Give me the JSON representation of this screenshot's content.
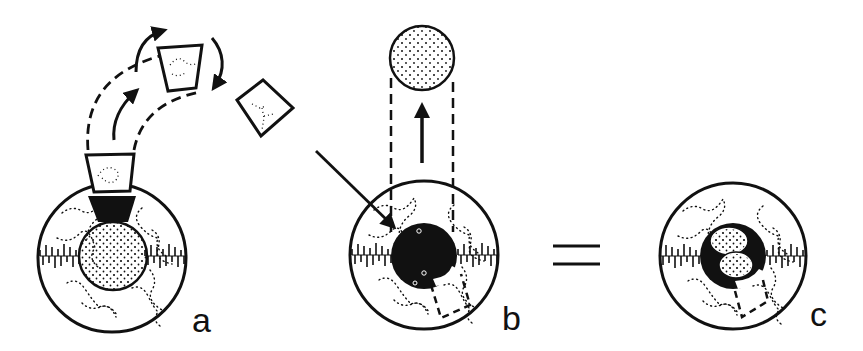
{
  "diagram": {
    "type": "illustration",
    "panels": [
      {
        "id": "a",
        "label": "a",
        "contents": [
          "outer ring with dotted texture",
          "dotted inner circle",
          "black wedge segment",
          "trapezoid piece lifted along dashed arc",
          "two rotated trapezoid pieces",
          "curved arrows"
        ]
      },
      {
        "id": "b",
        "label": "b",
        "contents": [
          "outer ring with dotted texture",
          "black central disc",
          "dotted circle lifted upward",
          "dashed vertical guides",
          "up arrow",
          "diagonal arrow pointing into disc",
          "dashed rectangle segment"
        ]
      },
      {
        "id": "c",
        "label": "c",
        "contents": [
          "outer ring with dotted texture",
          "black central disc",
          "two dotted ovals inside disc",
          "dashed rectangle segment"
        ]
      }
    ],
    "operator": "="
  },
  "labels": {
    "a": "a",
    "b": "b",
    "c": "c",
    "equals": "="
  },
  "colors": {
    "ink": "#111111",
    "background": "#ffffff"
  }
}
